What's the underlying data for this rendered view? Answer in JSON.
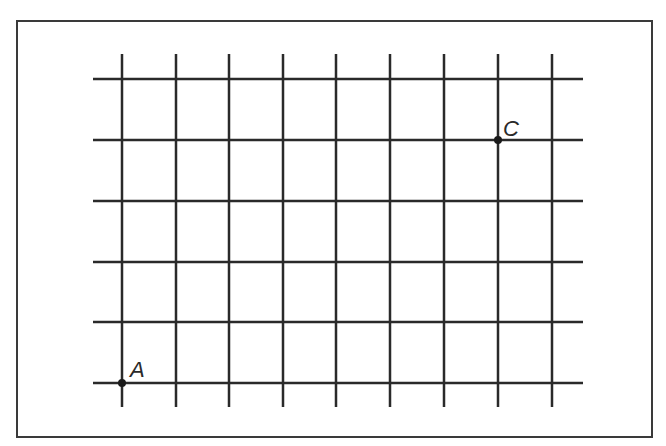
{
  "diagram": {
    "type": "grid",
    "frame": {
      "x": 17,
      "y": 21,
      "width": 635,
      "height": 416,
      "stroke": "#3a3a3a"
    },
    "grid": {
      "columns_x": [
        122,
        176,
        229,
        283,
        336,
        390,
        444,
        498,
        552
      ],
      "rows_y": [
        79,
        140,
        201,
        262,
        322,
        383
      ],
      "v_line_top": 54,
      "v_line_bottom": 407,
      "h_line_left": 93,
      "h_line_right": 583,
      "stroke": "#2a2a2a"
    },
    "points": [
      {
        "label": "A",
        "x": 122,
        "y": 383,
        "label_dx": 8,
        "label_dy": -6
      },
      {
        "label": "C",
        "x": 498,
        "y": 140,
        "label_dx": 5,
        "label_dy": -4
      }
    ]
  }
}
